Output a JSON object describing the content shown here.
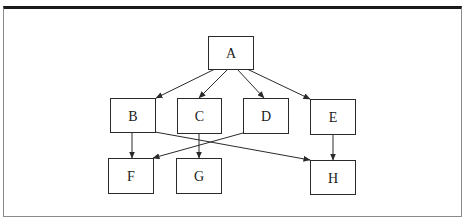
{
  "diagram": {
    "type": "tree/graph",
    "nodes": [
      {
        "id": "A",
        "label": "A",
        "level": 0
      },
      {
        "id": "B",
        "label": "B",
        "level": 1
      },
      {
        "id": "C",
        "label": "C",
        "level": 1
      },
      {
        "id": "D",
        "label": "D",
        "level": 1
      },
      {
        "id": "E",
        "label": "E",
        "level": 1
      },
      {
        "id": "F",
        "label": "F",
        "level": 2
      },
      {
        "id": "G",
        "label": "G",
        "level": 2
      },
      {
        "id": "H",
        "label": "H",
        "level": 2
      }
    ],
    "edges": [
      {
        "from": "A",
        "to": "B"
      },
      {
        "from": "A",
        "to": "C"
      },
      {
        "from": "A",
        "to": "D"
      },
      {
        "from": "A",
        "to": "E"
      },
      {
        "from": "B",
        "to": "F"
      },
      {
        "from": "B",
        "to": "H"
      },
      {
        "from": "C",
        "to": "G"
      },
      {
        "from": "D",
        "to": "F"
      },
      {
        "from": "E",
        "to": "H"
      }
    ],
    "colors": {
      "stroke": "#2a2a2a",
      "frame_top": "#1a1a1a",
      "frame_side": "#8a8a8a"
    }
  }
}
